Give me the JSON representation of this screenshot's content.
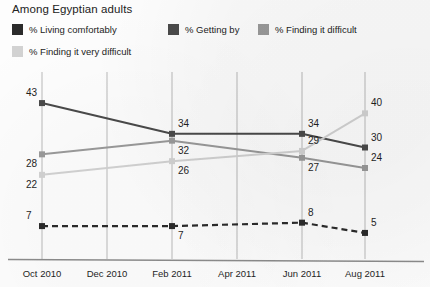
{
  "title": "Among Egyptian adults",
  "legend": [
    {
      "label": "% Living comfortably",
      "color": "#2b2b2b"
    },
    {
      "label": "% Getting by",
      "color": "#4a4a4a"
    },
    {
      "label": "% Finding it difficult",
      "color": "#9a9a9a"
    },
    {
      "label": "% Finding it very difficult",
      "color": "#d2d2d2"
    }
  ],
  "chart_data": {
    "type": "line",
    "title": "Among Egyptian adults",
    "xlabel": "",
    "ylabel": "",
    "ylim": [
      0,
      48
    ],
    "grid": true,
    "legend_position": "top",
    "categories": [
      "Oct 2010",
      "Feb 2011",
      "Jun 2011",
      "Aug 2011"
    ],
    "x_ticks": [
      "Oct 2010",
      "Dec 2010",
      "Feb 2011",
      "Apr 2011",
      "Jun 2011",
      "Aug 2011"
    ],
    "series": [
      {
        "name": "% Getting by",
        "color": "#4a4a4a",
        "style": "solid",
        "values": [
          43,
          34,
          34,
          30
        ],
        "label_offsets": [
          "above",
          "above",
          "above",
          "above"
        ]
      },
      {
        "name": "% Finding it difficult",
        "color": "#9a9a9a",
        "style": "solid",
        "values": [
          28,
          32,
          27,
          24
        ],
        "label_offsets": [
          "below",
          "below",
          "below",
          "above"
        ]
      },
      {
        "name": "% Finding it very difficult",
        "color": "#d2d2d2",
        "style": "solid",
        "values": [
          22,
          26,
          29,
          40
        ],
        "label_offsets": [
          "below",
          "below",
          "above",
          "above"
        ]
      },
      {
        "name": "% Living comfortably",
        "color": "#2b2b2b",
        "style": "dashed",
        "values": [
          7,
          7,
          8,
          5
        ],
        "label_offsets": [
          "above",
          "below",
          "above",
          "above"
        ]
      }
    ]
  }
}
